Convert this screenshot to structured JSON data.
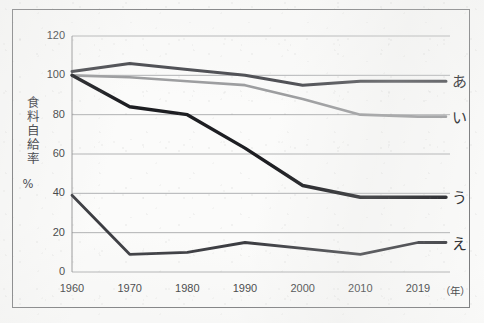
{
  "chart_data": {
    "type": "line",
    "title": "",
    "xlabel": "年",
    "ylabel": "食料自給率（%）",
    "ylabel_text": "食料自給率",
    "ylabel_unit": "%",
    "x_unit_label": "（年）",
    "categories": [
      "1960",
      "1970",
      "1980",
      "1990",
      "2000",
      "2010",
      "2019"
    ],
    "x": [
      1960,
      1970,
      1980,
      1990,
      2000,
      2010,
      2019
    ],
    "xlim": [
      1960,
      2019
    ],
    "ylim": [
      0,
      120
    ],
    "ytick_labels": [
      "120",
      "100",
      "80",
      "60",
      "40",
      "20",
      "0"
    ],
    "yticks": [
      120,
      100,
      80,
      60,
      40,
      20,
      0
    ],
    "grid": true,
    "grid_axis": "y",
    "legend_position": "right-end-of-line",
    "series": [
      {
        "name": "あ",
        "label": "あ",
        "color": "#4a4b50",
        "width": 3.0,
        "values": [
          102,
          106,
          103,
          100,
          95,
          97,
          97
        ]
      },
      {
        "name": "い",
        "label": "い",
        "color": "#9b9c9e",
        "width": 2.6,
        "values": [
          100,
          99,
          97,
          95,
          88,
          80,
          79
        ]
      },
      {
        "name": "う",
        "label": "う",
        "color": "#1d1e22",
        "width": 3.4,
        "values": [
          100,
          84,
          80,
          63,
          44,
          38,
          38
        ]
      },
      {
        "name": "え",
        "label": "え",
        "color": "#3c3d42",
        "width": 2.8,
        "values": [
          39,
          9,
          10,
          15,
          12,
          9,
          15
        ]
      }
    ]
  },
  "frame": {
    "border_color": "#77787a",
    "grid_color": "#a8a9ab",
    "axis_color": "#8a8b8d",
    "background": "#fbfbfa"
  }
}
